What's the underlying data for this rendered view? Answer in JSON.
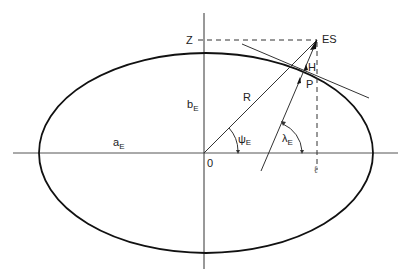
{
  "diagram": {
    "labels": {
      "z": "Z",
      "es": "ES",
      "h": "H",
      "p": "P",
      "r": "R",
      "b": "b",
      "b_sub": "E",
      "a": "a",
      "a_sub": "E",
      "origin": "0",
      "psi": "ψ",
      "psi_sub": "E",
      "lambda": "λ",
      "lambda_sub": "E",
      "ell": "ℓ"
    },
    "colors": {
      "stroke": "#222222",
      "background": "#ffffff"
    }
  }
}
